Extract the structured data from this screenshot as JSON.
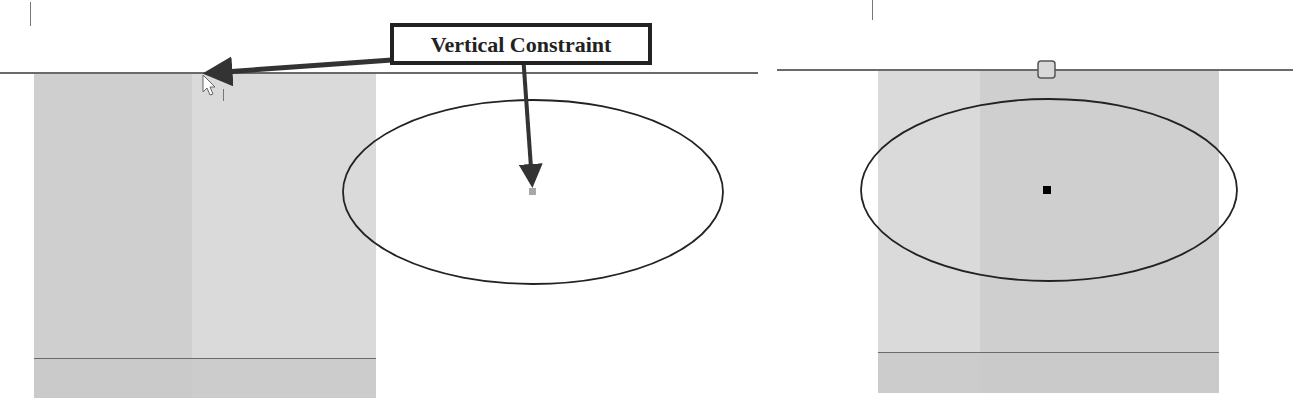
{
  "callout": {
    "label": "Vertical Constraint"
  },
  "left_view": {
    "description": "sketch before constraint - ellipse center not aligned with origin",
    "panel": {
      "x": 34,
      "y": 72,
      "width": 342,
      "height": 326
    },
    "horizontal_axis_y": 72,
    "ellipse": {
      "cx": 533,
      "cy": 192,
      "rx": 190,
      "ry": 92
    },
    "center_point_color": "#a0a0a0",
    "cursor": "pointer-cursor"
  },
  "right_view": {
    "description": "sketch after constraint - ellipse center vertically aligned with origin",
    "panel": {
      "x": 878,
      "y": 69,
      "width": 341,
      "height": 324
    },
    "horizontal_axis_y": 69,
    "ellipse": {
      "cx": 1049,
      "cy": 190,
      "rx": 188,
      "ry": 91
    },
    "center_point_color": "#000000",
    "constraint_glyph": "vertical-constraint-icon"
  },
  "colors": {
    "panel_dark": "#cfcfcf",
    "panel_light": "#dadada",
    "axis_line": "#6a6a6a",
    "ellipse_stroke": "#222222",
    "arrow": "#333333"
  }
}
